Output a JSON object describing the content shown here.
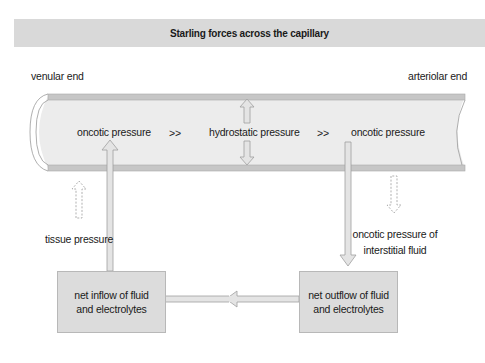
{
  "title": "Starling forces across the capillary",
  "ends": {
    "left": "venular end",
    "right": "arteriolar end"
  },
  "capillary_labels": {
    "left": "oncotic pressure",
    "sep1": ">>",
    "center": "hydrostatic pressure",
    "sep2": ">>",
    "right": "oncotic pressure"
  },
  "outside_labels": {
    "tissue": "tissue pressure",
    "interstitial_line1": "oncotic pressure of",
    "interstitial_line2": "interstitial fluid"
  },
  "boxes": {
    "inflow_line1": "net inflow of fluid",
    "inflow_line2": "and electrolytes",
    "outflow_line1": "net outflow of fluid",
    "outflow_line2": "and electrolytes"
  },
  "colors": {
    "title_bg": "#d9d9d9",
    "vessel_fill": "#ececec",
    "vessel_wall": "#bdbdbd",
    "box_fill": "#dcdcdc",
    "arrow_fill": "#e4e4e4",
    "arrow_stroke": "#a8a8a8"
  }
}
